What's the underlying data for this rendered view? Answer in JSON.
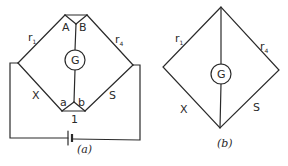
{
  "figure": {
    "diagram_a": {
      "caption": "(a)",
      "labels": {
        "r1": "r",
        "r1_sub": "1",
        "r4": "r",
        "r4_sub": "4",
        "A": "A",
        "B": "B",
        "galvanometer": "G",
        "X": "X",
        "S": "S",
        "a": "a",
        "b": "b",
        "one": "1"
      },
      "components": [
        "galvanometer",
        "battery",
        "resistor r1",
        "resistor r4",
        "resistor X",
        "resistor S"
      ]
    },
    "diagram_b": {
      "caption": "(b)",
      "labels": {
        "r1": "r",
        "r1_sub": "1",
        "r4": "r",
        "r4_sub": "4",
        "galvanometer": "G",
        "X": "X",
        "S": "S"
      }
    },
    "colors": {
      "line": "#2a2a2a",
      "background": "#ffffff"
    }
  }
}
